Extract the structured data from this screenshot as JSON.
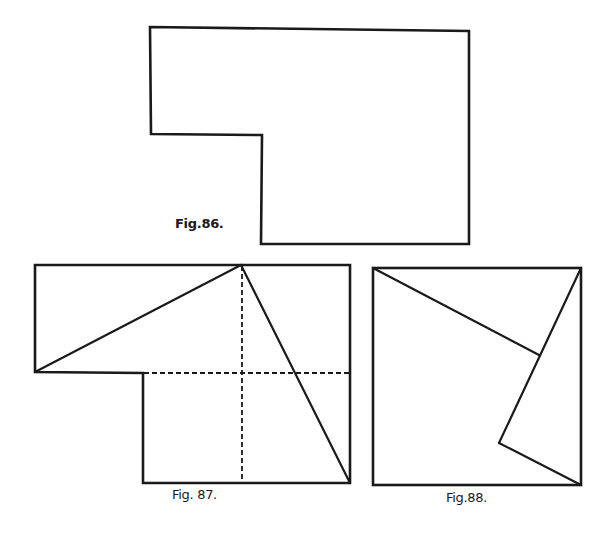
{
  "figures": [
    {
      "id": "fig86",
      "caption": "Fig.86.",
      "description": "L-shaped outline (rectangle with lower-left corner removed)",
      "outline_points": [
        [
          150,
          27
        ],
        [
          469,
          31
        ],
        [
          469,
          244
        ],
        [
          261,
          244
        ],
        [
          262,
          135
        ],
        [
          151,
          134
        ]
      ]
    },
    {
      "id": "fig87",
      "caption": "Fig. 87.",
      "description": "Same L-shape with two cut lines from top apex and dashed grid lines",
      "outline_points": [
        [
          35,
          265
        ],
        [
          350,
          265
        ],
        [
          350,
          483
        ],
        [
          143,
          483
        ],
        [
          143,
          373
        ],
        [
          35,
          372
        ]
      ],
      "solid_lines": [
        [
          [
            35,
            372
          ],
          [
            241,
            265
          ]
        ],
        [
          [
            241,
            265
          ],
          [
            350,
            483
          ]
        ]
      ],
      "dashed_lines": [
        [
          [
            242,
            265
          ],
          [
            242,
            483
          ]
        ],
        [
          [
            143,
            373
          ],
          [
            350,
            373
          ]
        ]
      ]
    },
    {
      "id": "fig88",
      "caption": "Fig.88.",
      "description": "Square formed by rearranging pieces of the L-shape",
      "outline_points": [
        [
          373,
          268
        ],
        [
          581,
          268
        ],
        [
          581,
          485
        ],
        [
          373,
          485
        ]
      ],
      "solid_lines": [
        [
          [
            373,
            268
          ],
          [
            539,
            355
          ]
        ],
        [
          [
            581,
            268
          ],
          [
            499,
            443
          ]
        ],
        [
          [
            499,
            443
          ],
          [
            581,
            485
          ]
        ]
      ]
    }
  ],
  "colors": {
    "ink": "#1a1a1a",
    "paper": "#ffffff"
  }
}
